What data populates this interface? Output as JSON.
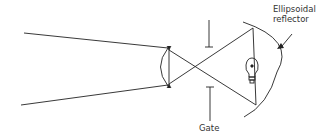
{
  "diagram": {
    "type": "optical-schematic",
    "labels": {
      "reflector_line1": "Ellipsoidal",
      "reflector_line2": "reflector",
      "gate": "Gate"
    },
    "components": [
      "lens",
      "gate",
      "lamp",
      "ellipsoidal-reflector",
      "light-beam"
    ],
    "colors": {
      "stroke": "#222222",
      "text": "#333333",
      "background": "#ffffff"
    }
  }
}
